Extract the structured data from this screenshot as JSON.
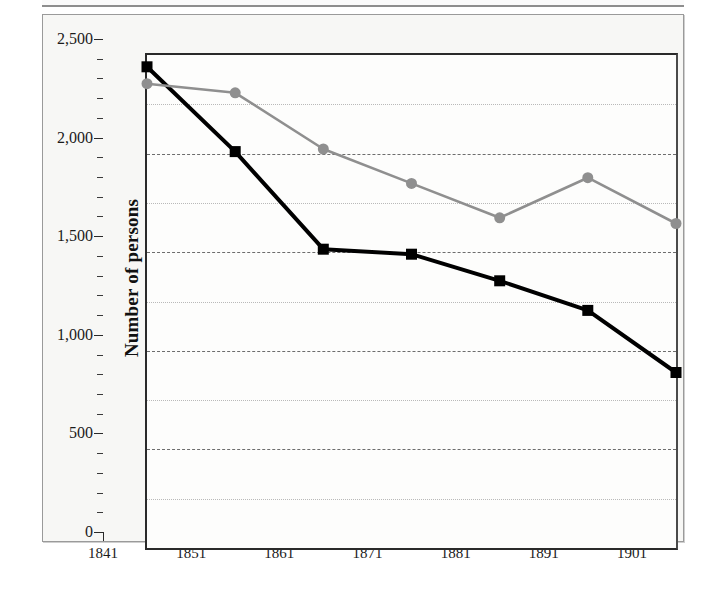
{
  "chart_data": {
    "type": "line",
    "title": "",
    "xlabel": "",
    "ylabel": "Number of persons",
    "y2label": "Number of houses",
    "categories": [
      "1841",
      "1851",
      "1861",
      "1871",
      "1881",
      "1891",
      "1901"
    ],
    "x": [
      1841,
      1851,
      1861,
      1871,
      1881,
      1891,
      1901
    ],
    "ylim": [
      0,
      2500
    ],
    "y2lim": [
      0,
      430
    ],
    "yticks": [
      0,
      500,
      1000,
      1500,
      2000,
      2500
    ],
    "ytick_labels": [
      "0",
      "500",
      "1,000",
      "1,500",
      "2,000",
      "2,500"
    ],
    "yminor_ticks": [
      250,
      750,
      1250,
      1750,
      2250
    ],
    "y2ticks": [
      0,
      100,
      200,
      300,
      400
    ],
    "y2tick_labels": [
      "0",
      "100",
      "200",
      "300",
      "400"
    ],
    "y2minor_ticks": [
      50,
      150,
      250,
      350
    ],
    "grid": true,
    "legend": "none",
    "series": [
      {
        "name": "Number of persons",
        "axis": "left",
        "color": "#000000",
        "marker": "square",
        "values": [
          2440,
          2010,
          1515,
          1490,
          1355,
          1205,
          890
        ]
      },
      {
        "name": "Number of houses",
        "axis": "right",
        "color": "#8f8f8f",
        "marker": "circle",
        "values": [
          405,
          397,
          348,
          318,
          288,
          323,
          283
        ]
      }
    ]
  },
  "axes": {
    "left_title": "Number of persons",
    "right_title": "Number of houses",
    "left_labels": [
      "2,500",
      "2,000",
      "1,500",
      "1,000",
      "500",
      "0"
    ],
    "right_labels": [
      "400",
      "300",
      "200",
      "100",
      "0"
    ],
    "x_labels": [
      "1841",
      "1851",
      "1861",
      "1871",
      "1881",
      "1891",
      "1901"
    ]
  }
}
